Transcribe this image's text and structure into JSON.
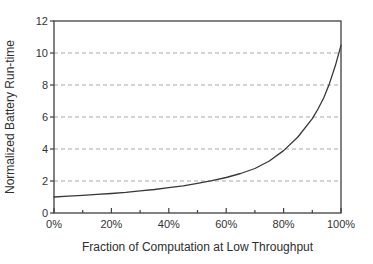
{
  "figure": {
    "background": "#ffffff",
    "axis_color": "#3f3f3f",
    "grid_color": "#a8a8a8",
    "line_color": "#383838",
    "text_color": "#2e2e2e"
  },
  "chart_data": {
    "type": "line",
    "title": "",
    "xlabel": "Fraction of Computation at Low Throughput",
    "ylabel": "Normalized Battery Run-time",
    "xlim": [
      0,
      100
    ],
    "ylim": [
      0,
      12
    ],
    "xticks_major": [
      0,
      20,
      40,
      60,
      80,
      100
    ],
    "xtick_labels": [
      "0%",
      "20%",
      "40%",
      "60%",
      "80%",
      "100%"
    ],
    "xticks_minor": [
      10,
      30,
      50,
      70,
      90
    ],
    "yticks": [
      0,
      2,
      4,
      6,
      8,
      10,
      12
    ],
    "ytick_labels": [
      "0",
      "2",
      "4",
      "6",
      "8",
      "10",
      "12"
    ],
    "gridlines_y": [
      2,
      4,
      6,
      8,
      10
    ],
    "grid_style": "dashed",
    "legend": null,
    "series": [
      {
        "name": "normalized-battery-runtime",
        "x": [
          0,
          5,
          10,
          15,
          20,
          25,
          30,
          35,
          40,
          45,
          50,
          55,
          60,
          65,
          70,
          75,
          80,
          85,
          90,
          92,
          94,
          96,
          98,
          100
        ],
        "y": [
          1.0,
          1.05,
          1.1,
          1.16,
          1.22,
          1.29,
          1.38,
          1.47,
          1.58,
          1.7,
          1.85,
          2.02,
          2.22,
          2.47,
          2.78,
          3.25,
          3.9,
          4.75,
          5.9,
          6.5,
          7.2,
          8.1,
          9.2,
          10.48
        ]
      }
    ]
  }
}
